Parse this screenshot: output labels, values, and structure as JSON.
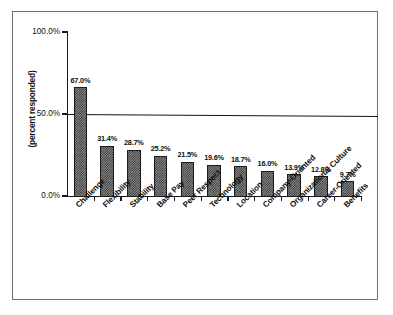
{
  "chart_data": {
    "type": "bar",
    "title": "",
    "subtitle": "",
    "xlabel": "",
    "ylabel": "(percent responded)",
    "ylim": [
      0,
      100
    ],
    "ytick_labels": [
      "100.0%",
      "50.0%",
      "0.0%"
    ],
    "ytick_values": [
      100,
      50,
      0
    ],
    "grid": false,
    "legend": null,
    "annotations": [
      {
        "name": "reference-line",
        "value": 50,
        "orientation": "horizontal"
      }
    ],
    "categories": [
      "Challenge",
      "Flexibility",
      "Stability",
      "Base Pay",
      "Peer Respect",
      "Technology",
      "Location",
      "Company-Oriented",
      "Organizational Culture",
      "Career-Oriented",
      "Benefits"
    ],
    "values": [
      67.0,
      31.4,
      28.7,
      25.2,
      21.5,
      19.6,
      18.7,
      16.0,
      13.9,
      12.8,
      9.7
    ],
    "data_labels": [
      "67.0%",
      "31.4%",
      "28.7%",
      "25.2%",
      "21.5%",
      "19.6%",
      "18.7%",
      "16.0%",
      "13.9%",
      "12.8%",
      "9.7%"
    ],
    "bar_fill": "#8a8a8a",
    "bar_pattern": "checkerboard-dither",
    "bar_edge_color": "#1b1b1b",
    "axis_color": "#1a1a1a",
    "background_color": "#ffffff",
    "frame_color": "#6e6e6e"
  }
}
